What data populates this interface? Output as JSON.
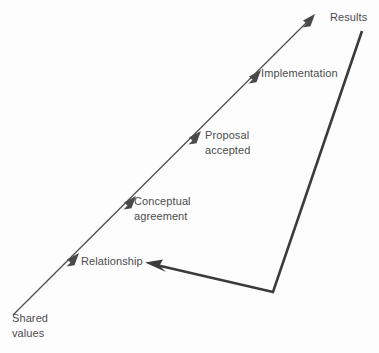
{
  "diagram": {
    "type": "flow-diagram",
    "background_color": "#fdfdfd",
    "line_color": "#4a4a4a",
    "thick_line_color": "#3b3b3b",
    "text_color": "#4c4c4c",
    "main_axis": {
      "description": "ascending diagonal arrow",
      "start": [
        13,
        315
      ],
      "end": [
        315,
        14
      ]
    },
    "feedback_path": {
      "description": "thick return arrow from Results down to Relationship",
      "points": [
        [
          362,
          31
        ],
        [
          273,
          292
        ],
        [
          146,
          263
        ]
      ]
    },
    "nodes": [
      {
        "id": "shared-values",
        "line1": "Shared",
        "line2": "values",
        "x": 12,
        "y": 311,
        "has_arrowhead": false
      },
      {
        "id": "relationship",
        "line1": "Relationship",
        "line2": "",
        "x": 81,
        "y": 254,
        "has_arrowhead": true,
        "arrow_tip": [
          137,
          196
        ]
      },
      {
        "id": "conceptual-agreement",
        "line1": "Conceptual",
        "line2": "agreement",
        "x": 134,
        "y": 194,
        "has_arrowhead": true
      },
      {
        "id": "proposal-accepted",
        "line1": "Proposal",
        "line2": "accepted",
        "x": 205,
        "y": 128,
        "has_arrowhead": true
      },
      {
        "id": "implementation",
        "line1": "Implementation",
        "line2": "",
        "x": 261,
        "y": 66,
        "has_arrowhead": true
      },
      {
        "id": "results",
        "line1": "Results",
        "line2": "",
        "x": 330,
        "y": 10,
        "has_arrowhead": true
      }
    ]
  }
}
